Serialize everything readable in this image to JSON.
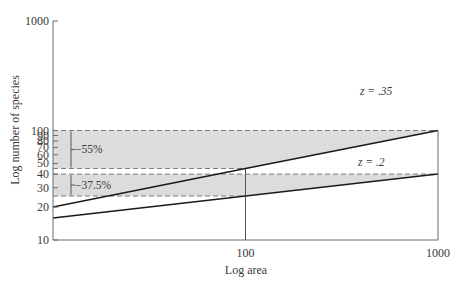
{
  "chart_data": {
    "type": "line",
    "title": "",
    "xlabel": "Log area",
    "ylabel": "Log number of species",
    "xscale": "log",
    "yscale": "log",
    "xlim": [
      10,
      1000
    ],
    "ylim": [
      10,
      1000
    ],
    "x_ticks": [
      {
        "value": 100,
        "label": "100"
      },
      {
        "value": 1000,
        "label": "1000"
      }
    ],
    "y_ticks": [
      {
        "value": 1000,
        "label": "1000"
      },
      {
        "value": 100,
        "label": "100"
      },
      {
        "value": 90,
        "label": "90"
      },
      {
        "value": 80,
        "label": "80"
      },
      {
        "value": 70,
        "label": "70"
      },
      {
        "value": 60,
        "label": "60"
      },
      {
        "value": 50,
        "label": "50"
      },
      {
        "value": 40,
        "label": "40"
      },
      {
        "value": 30,
        "label": "30"
      },
      {
        "value": 20,
        "label": "20"
      },
      {
        "value": 10,
        "label": "10"
      }
    ],
    "series": [
      {
        "name": "z = .35",
        "label": "z = .35",
        "x": [
          10,
          100,
          1000
        ],
        "y": [
          20,
          45,
          100
        ]
      },
      {
        "name": "z = .2",
        "label": "z = .2",
        "x": [
          10,
          100,
          1000
        ],
        "y": [
          15.9,
          25.2,
          40
        ]
      }
    ],
    "bands": [
      {
        "y_low": 45,
        "y_high": 100,
        "label": "−55%"
      },
      {
        "y_low": 25.2,
        "y_high": 40,
        "label": "−37.5%"
      }
    ],
    "reference_line": {
      "x": 100
    },
    "grid": false,
    "colors": {
      "line": "#1a1a1a",
      "band": "#dcdcdc",
      "dash": "#7a7a7a",
      "axis": "#6a6a6a",
      "text": "#3a3a3a"
    }
  }
}
